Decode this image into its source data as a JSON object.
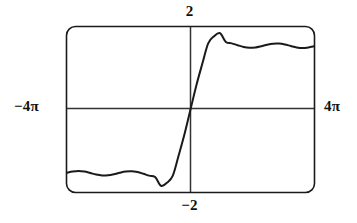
{
  "figure": {
    "kind": "graphing-calculator-viewing-window",
    "labels": {
      "top": "2",
      "bottom": "−2",
      "left": "−4π",
      "right": "4π"
    },
    "colors": {
      "curve": "#1a1a1a",
      "frame": "#1a1a1a",
      "axis": "#333333",
      "background": "#ffffff"
    }
  },
  "chart_data": {
    "type": "line",
    "title": "",
    "xlabel": "",
    "ylabel": "",
    "xlim": [
      -12.566370614359172,
      12.566370614359172
    ],
    "ylim": [
      -2,
      2
    ],
    "xtick_labels": [
      "−4π",
      "4π"
    ],
    "ytick_labels": [
      "−2",
      "2"
    ],
    "grid": false,
    "legend": null,
    "axes_drawn": [
      "x-axis at y=0",
      "y-axis at x=0"
    ],
    "series": [
      {
        "name": "Si(x)",
        "description": "Odd, sigmoid-like curve through the origin with damped oscillations approaching ±π/2",
        "x": [
          -12.566,
          -12.0,
          -11.4,
          -10.8,
          -10.2,
          -9.6,
          -9.0,
          -8.4,
          -7.8,
          -7.2,
          -6.6,
          -6.0,
          -5.4,
          -4.8,
          -4.2,
          -3.6,
          -3.0,
          -2.4,
          -1.8,
          -1.2,
          -0.6,
          0.0,
          0.6,
          1.2,
          1.8,
          2.4,
          3.0,
          3.6,
          4.2,
          4.8,
          5.4,
          6.0,
          6.6,
          7.2,
          7.8,
          8.4,
          9.0,
          9.6,
          10.2,
          10.8,
          11.4,
          12.0,
          12.566
        ],
        "y": [
          -1.534,
          -1.505,
          -1.491,
          -1.505,
          -1.539,
          -1.576,
          -1.598,
          -1.595,
          -1.57,
          -1.534,
          -1.504,
          -1.496,
          -1.516,
          -1.557,
          -1.604,
          -1.636,
          -1.849,
          -1.778,
          -1.605,
          -1.108,
          -0.588,
          0.0,
          0.588,
          1.108,
          1.605,
          1.778,
          1.849,
          1.636,
          1.604,
          1.557,
          1.516,
          1.496,
          1.504,
          1.534,
          1.57,
          1.595,
          1.598,
          1.576,
          1.539,
          1.505,
          1.491,
          1.505,
          1.534
        ]
      }
    ],
    "annotations": [
      {
        "text": "2",
        "position": "top-center",
        "meaning": "y-axis maximum"
      },
      {
        "text": "−2",
        "position": "bottom-center",
        "meaning": "y-axis minimum"
      },
      {
        "text": "−4π",
        "position": "left-middle",
        "meaning": "x-axis minimum"
      },
      {
        "text": "4π",
        "position": "right-middle",
        "meaning": "x-axis maximum"
      }
    ]
  }
}
